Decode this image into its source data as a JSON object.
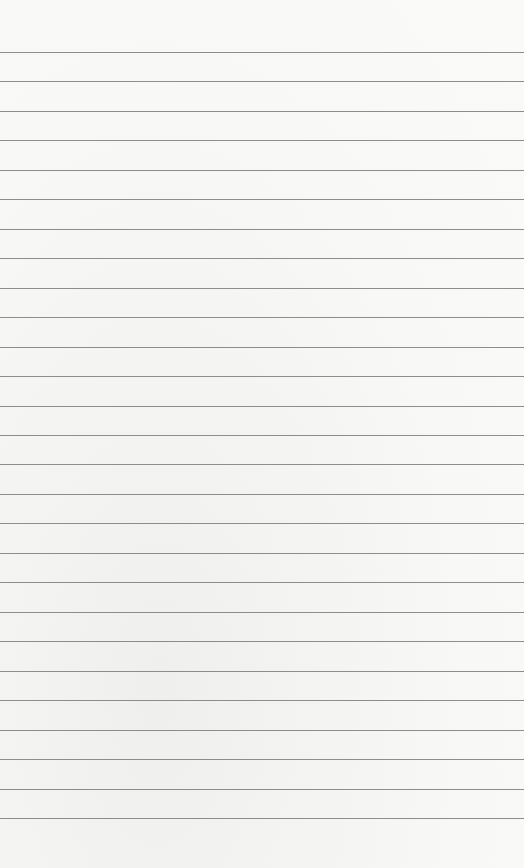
{
  "paper": {
    "type": "lined-paper",
    "background_color": "#f7f7f6",
    "line_color": "#7a7a7a",
    "first_line_y": 52,
    "line_spacing": 29.46,
    "line_count": 27
  }
}
